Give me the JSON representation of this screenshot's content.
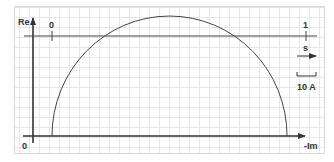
{
  "diagram": {
    "type": "circle-diagram",
    "axes": {
      "vertical_label": "Re",
      "horizontal_label": "-Im",
      "origin_label": "0"
    },
    "slip_line": {
      "start_label": "0",
      "end_label": "1"
    },
    "slip_arrow_label": "s",
    "scale_bar_label": "10 A",
    "colors": {
      "line": "#333333",
      "grid": "#e6e6e6",
      "background": "#ffffff"
    }
  }
}
